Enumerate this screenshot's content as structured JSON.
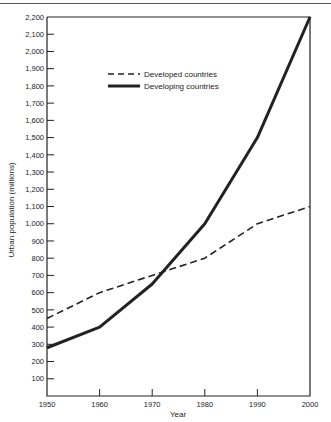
{
  "header": {
    "cut_text": "Urban population growth by region"
  },
  "chart_data": {
    "type": "line",
    "title": "",
    "xlabel": "Year",
    "ylabel": "Urban population (millions)",
    "x": [
      1950,
      1960,
      1970,
      1980,
      1990,
      2000
    ],
    "xlim": [
      1950,
      2000
    ],
    "ylim": [
      0,
      2200
    ],
    "x_ticks": [
      "1950",
      "1960",
      "1970",
      "1980",
      "1990",
      "2000"
    ],
    "y_ticks": [
      "100",
      "200",
      "300",
      "400",
      "500",
      "600",
      "700",
      "800",
      "900",
      "1,000",
      "1,100",
      "1,200",
      "1,300",
      "1,400",
      "1,500",
      "1,600",
      "1,700",
      "1,800",
      "1,900",
      "2,000",
      "2,100",
      "2,200"
    ],
    "grid": false,
    "legend_position": "upper-center",
    "series": [
      {
        "name": "Developed countries",
        "style": "dashed",
        "color": "#222222",
        "values": [
          450,
          600,
          700,
          800,
          1000,
          1100
        ]
      },
      {
        "name": "Developing countries",
        "style": "solid-thick",
        "color": "#222222",
        "values": [
          280,
          400,
          650,
          1000,
          1500,
          2200
        ]
      }
    ]
  }
}
